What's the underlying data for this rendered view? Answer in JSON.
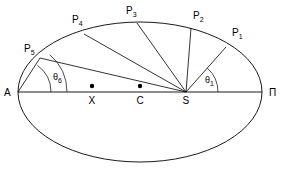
{
  "figure": {
    "type": "geometry-diagram",
    "background_color": "#ffffff",
    "stroke_color": "#000000"
  },
  "ellipse": {
    "center_x": 140,
    "center_y": 92,
    "semi_major": 122,
    "semi_minor": 70
  },
  "axis": {
    "label_left": "A",
    "label_right": "Π",
    "left_x": 18,
    "right_x": 262,
    "y": 92
  },
  "points_on_axis": [
    {
      "name": "X",
      "label": "X",
      "x": 92,
      "y": 92,
      "has_dot": true
    },
    {
      "name": "C",
      "label": "C",
      "x": 140,
      "y": 92,
      "has_dot": true
    },
    {
      "name": "S",
      "label": "S",
      "x": 186,
      "y": 92,
      "has_dot": false
    }
  ],
  "orbit_points": [
    {
      "name": "P1",
      "label": "P",
      "sub": "1",
      "x": 226,
      "y": 47,
      "label_x": 232,
      "label_y": 36
    },
    {
      "name": "P2",
      "label": "P",
      "sub": "2",
      "x": 191,
      "y": 28,
      "label_x": 193,
      "label_y": 19
    },
    {
      "name": "P3",
      "label": "P",
      "sub": "3",
      "x": 137,
      "y": 23,
      "label_x": 126,
      "label_y": 14
    },
    {
      "name": "P4",
      "label": "P",
      "sub": "4",
      "x": 84,
      "y": 34,
      "label_x": 72,
      "label_y": 23
    },
    {
      "name": "P5",
      "label": "P",
      "sub": "5",
      "x": 40,
      "y": 58,
      "label_x": 24,
      "label_y": 52
    }
  ],
  "rays_from_focus": [
    {
      "from": "S",
      "to": "P1"
    },
    {
      "from": "S",
      "to": "P2"
    },
    {
      "from": "S",
      "to": "P3"
    },
    {
      "from": "S",
      "to": "P4"
    },
    {
      "from": "S",
      "to": "P5"
    }
  ],
  "rays_from_apoapsis": [
    {
      "from": "A",
      "to": "P5"
    }
  ],
  "angles": [
    {
      "name": "theta1",
      "label": "θ",
      "sub": "1",
      "vertex": "S",
      "label_x": 205,
      "label_y": 83,
      "arc_radius": 32,
      "from_deg": 0,
      "to_deg": 48
    },
    {
      "name": "theta6",
      "label": "θ",
      "sub": "6",
      "vertex": "A",
      "label_x": 53,
      "label_y": 80,
      "arc_radius": 33,
      "from_deg": 0,
      "to_deg": 54
    }
  ],
  "legend": {
    "A": "apoapsis",
    "Pi": "periapsis",
    "C": "center",
    "S": "focus",
    "X": "auxiliary point"
  }
}
